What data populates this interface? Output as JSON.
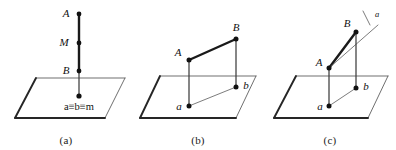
{
  "figure": {
    "background_color": "#ffffff",
    "ink_color": "#111111",
    "plane_edge_color": "#262626"
  },
  "panels": [
    {
      "id": "a",
      "caption": "(a)",
      "description": "Vertical segment perpendicular to the plane; A, M and B all project to one point.",
      "labels": {
        "top_point": "A",
        "mid_point": "M",
        "low_point": "B",
        "projection": "a≡b≡m"
      },
      "points": [
        {
          "name": "A",
          "label": "A",
          "x": 79,
          "y": 14
        },
        {
          "name": "M",
          "label": "M",
          "x": 79,
          "y": 43
        },
        {
          "name": "B",
          "label": "B",
          "x": 79,
          "y": 71
        },
        {
          "name": "projection",
          "label": "a≡b≡m",
          "x": 79,
          "y": 96
        }
      ]
    },
    {
      "id": "b",
      "caption": "(b)",
      "description": "Oblique segment AB above the plane projecting to segment ab in the plane.",
      "labels": {
        "upper_left_point": "A",
        "upper_right_point": "B",
        "lower_left_point": "a",
        "lower_right_point": "b"
      },
      "points": [
        {
          "name": "A",
          "label": "A",
          "x": 189,
          "y": 60
        },
        {
          "name": "B",
          "label": "B",
          "x": 236,
          "y": 39
        },
        {
          "name": "a",
          "label": "a",
          "x": 189,
          "y": 106
        },
        {
          "name": "b",
          "label": "b",
          "x": 236,
          "y": 87
        }
      ]
    },
    {
      "id": "c",
      "caption": "(c)",
      "description": "Ray a from A through B extended beyond the plane; projection ab shown in the plane.",
      "labels": {
        "upper_right_point": "B",
        "left_point": "A",
        "lower_left_point": "a",
        "lower_right_point": "b",
        "ray_label": "a"
      },
      "points": [
        {
          "name": "A",
          "label": "A",
          "x": 329,
          "y": 68
        },
        {
          "name": "B",
          "label": "B",
          "x": 356,
          "y": 32
        },
        {
          "name": "a",
          "label": "a",
          "x": 329,
          "y": 106
        },
        {
          "name": "b",
          "label": "b",
          "x": 356,
          "y": 88
        }
      ],
      "ray": {
        "label": "a",
        "tick": true
      }
    }
  ]
}
